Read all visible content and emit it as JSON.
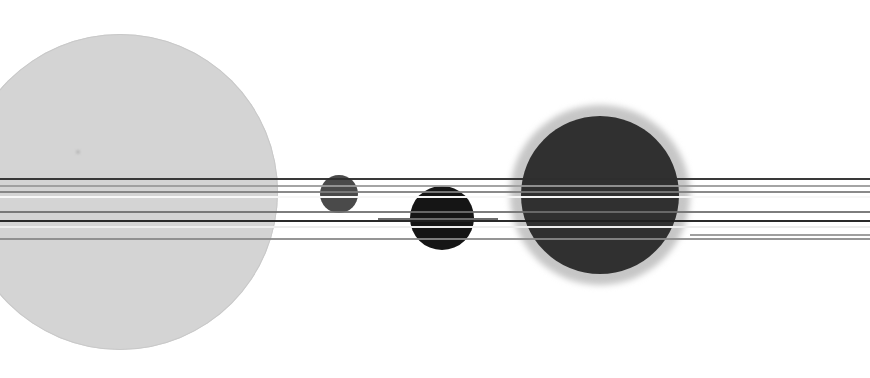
{
  "scene": {
    "title": "Astronomical transit field composite",
    "canvas": {
      "width": 870,
      "height": 378,
      "background": "#ffffff"
    },
    "description": "Greyscale astronomical composite showing four disc-shaped bodies of differing size and brightness crossed by several horizontal streak lines."
  },
  "palette": {
    "background": "#ffffff",
    "large_disc_fill": "#d4d4d4",
    "large_disc_edge": "#c9c9c9",
    "small_grey_disc_fill": "#4a4a4a",
    "black_disc_fill": "#151515",
    "dark_disc_fill": "#303030",
    "dark_disc_halo": "#c6c6c6",
    "streak_dark": "#2b2b2b",
    "streak_mid": "#8f8f8f",
    "streak_light": "#f4f4f4",
    "streak_white": "#ffffff"
  },
  "bodies": [
    {
      "id": "body-1",
      "name": "large-light-disc",
      "label": "Large light disc",
      "cx": 120,
      "cy": 192,
      "radius": 158,
      "fill": "#d4d4d4",
      "halo_radius": 0,
      "halo_fill": "none",
      "brightness": "light",
      "speck": {
        "x": 78,
        "y": 152,
        "radius": 2,
        "fill": "#b9b9b9"
      }
    },
    {
      "id": "body-2",
      "name": "small-grey-disc",
      "label": "Small grey disc",
      "cx": 339,
      "cy": 194,
      "radius": 19,
      "fill": "#4a4a4a",
      "halo_radius": 0,
      "halo_fill": "none",
      "brightness": "medium-dark"
    },
    {
      "id": "body-3",
      "name": "black-disc",
      "label": "Black disc",
      "cx": 442,
      "cy": 218,
      "radius": 32,
      "fill": "#151515",
      "halo_radius": 0,
      "halo_fill": "none",
      "brightness": "dark"
    },
    {
      "id": "body-4",
      "name": "large-dark-disc",
      "label": "Large dark disc with halo",
      "cx": 600,
      "cy": 195,
      "radius": 79,
      "fill": "#303030",
      "halo_radius": 90,
      "halo_fill": "#c6c6c6",
      "brightness": "dark"
    }
  ],
  "streaks": [
    {
      "id": "streak-1",
      "name": "streak-line-1",
      "y": 179,
      "thickness": 1.4,
      "color": "#2e2e2e",
      "opacity": 0.95
    },
    {
      "id": "streak-2",
      "name": "streak-line-2",
      "y": 186,
      "thickness": 1.2,
      "color": "#9a9a9a",
      "opacity": 0.9
    },
    {
      "id": "streak-3",
      "name": "streak-line-3",
      "y": 192,
      "thickness": 1.6,
      "color": "#7d7d7d",
      "opacity": 0.9
    },
    {
      "id": "streak-4",
      "name": "streak-line-4",
      "y": 197,
      "thickness": 2.6,
      "color": "#f7f7f7",
      "opacity": 1
    },
    {
      "id": "streak-5",
      "name": "streak-line-5",
      "y": 212,
      "thickness": 1.8,
      "color": "#6f6f6f",
      "opacity": 0.9
    },
    {
      "id": "streak-6",
      "name": "streak-line-6",
      "y": 221,
      "thickness": 1.6,
      "color": "#1f1f1f",
      "opacity": 0.95
    },
    {
      "id": "streak-7",
      "name": "streak-line-7",
      "y": 227,
      "thickness": 2.2,
      "color": "#ededed",
      "opacity": 1
    },
    {
      "id": "streak-8",
      "name": "streak-line-8",
      "y": 239,
      "thickness": 1.3,
      "color": "#8a8a8a",
      "opacity": 0.9
    }
  ],
  "partial_streaks": [
    {
      "id": "pstreak-1",
      "name": "partial-streak-left",
      "y": 219,
      "x": 378,
      "width": 120,
      "thickness": 1.4,
      "color": "#6b6b6b"
    },
    {
      "id": "pstreak-2",
      "name": "partial-streak-right",
      "y": 235,
      "x": 690,
      "width": 180,
      "thickness": 1.2,
      "color": "#9f9f9f"
    }
  ],
  "chart_data": {
    "type": "scatter",
    "xlabel": "x (px)",
    "ylabel": "y (px)",
    "xlim": [
      0,
      870
    ],
    "ylim": [
      0,
      378
    ],
    "grid": false,
    "legend": "none",
    "series": [
      {
        "name": "discs",
        "points": [
          {
            "x": 120,
            "y": 192,
            "r": 158,
            "value": "#d4d4d4"
          },
          {
            "x": 339,
            "y": 194,
            "r": 19,
            "value": "#4a4a4a"
          },
          {
            "x": 442,
            "y": 218,
            "r": 32,
            "value": "#151515"
          },
          {
            "x": 600,
            "y": 195,
            "r": 79,
            "value": "#303030"
          }
        ]
      },
      {
        "name": "horizontal-streaks",
        "y_values": [
          179,
          186,
          192,
          197,
          212,
          221,
          227,
          239
        ]
      }
    ]
  }
}
